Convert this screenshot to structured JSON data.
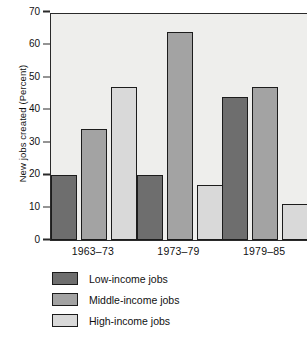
{
  "chart_data": {
    "type": "bar",
    "title": "",
    "xlabel": "",
    "ylabel": "New jobs created (Percent)",
    "categories": [
      "1963–73",
      "1973–79",
      "1979–85"
    ],
    "series": [
      {
        "name": "Low-income jobs",
        "color": "#6e6e6e",
        "values": [
          20,
          20,
          44
        ]
      },
      {
        "name": "Middle-income jobs",
        "color": "#a3a3a3",
        "values": [
          34,
          64,
          47
        ]
      },
      {
        "name": "High-income jobs",
        "color": "#d9d9d9",
        "values": [
          47,
          17,
          11
        ]
      }
    ],
    "ylim": [
      0,
      70
    ],
    "yticks": [
      0,
      10,
      20,
      30,
      40,
      50,
      60,
      70
    ],
    "ytick_labels": [
      "0",
      "10",
      "20",
      "30",
      "40",
      "50",
      "60",
      "70"
    ],
    "grid": false,
    "legend_position": "below-plot",
    "plot_background": "#eeeeec",
    "axis_color": "#2a2a2a"
  },
  "legend": {
    "items": [
      {
        "label": "Low-income jobs"
      },
      {
        "label": "Middle-income jobs"
      },
      {
        "label": "High-income jobs"
      }
    ]
  }
}
